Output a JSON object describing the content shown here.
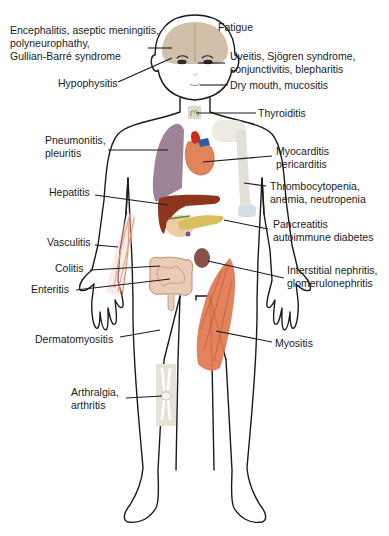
{
  "diagram": {
    "labels": {
      "neuro": "Encephalitis, aseptic meningitis,\npolyneurophathy,\nGullian-Barré syndrome",
      "fatigue": "Fatigue",
      "hypophysitis": "Hypophysitis",
      "eye": "Uveitis, Sjögren syndrome,\nconjunctivitis, blepharitis",
      "mouth": "Dry mouth, mucositis",
      "thyroid": "Thyroiditis",
      "lung": "Pneumonitis,\npleuritis",
      "heart": "Myocarditis\npericarditis",
      "blood": "Thrombocytopenia,\nanemia, neutropenia",
      "liver": "Hepatitis",
      "pancreas": "Pancreatitis\nautoimmune diabetes",
      "vessels": "Vasculitis",
      "colon": "Colitis",
      "kidney": "Interstitial nephritis,\nglomerulonephritis",
      "intestine": "Enteritis",
      "skin": "Dermatomyositis",
      "muscle": "Myositis",
      "joint": "Arthralgia,\narthritis"
    },
    "colors": {
      "outline": "#1a1a1a",
      "brain": "#c9b49a",
      "lung": "#9c8496",
      "heart": "#e0855a",
      "heart_vessels_red": "#d42a1c",
      "heart_vessels_blue": "#2a5aa8",
      "liver": "#8e3520",
      "pancreas": "#d8c060",
      "kidney": "#8a5048",
      "intestine": "#e8c4b0",
      "muscle": "#e07850",
      "bone": "#e4e0d8",
      "vessel": "#d86a48"
    }
  }
}
